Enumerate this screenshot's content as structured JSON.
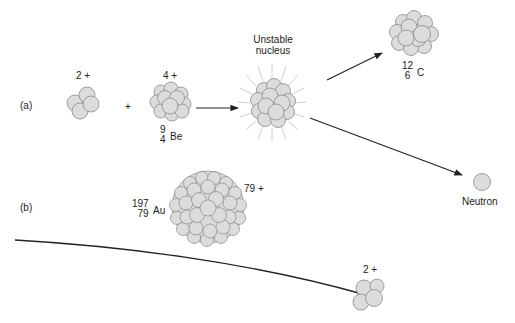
{
  "figure": {
    "panel_a": {
      "label": "(a)",
      "alpha": {
        "charge": "2 +"
      },
      "plus": "+",
      "beryllium": {
        "charge": "4 +",
        "mass_number": "9",
        "atomic_number": "4",
        "symbol": "Be"
      },
      "unstable": {
        "line1": "Unstable",
        "line2": "nucleus"
      },
      "carbon": {
        "mass_number": "12",
        "atomic_number": "6",
        "symbol": "C"
      },
      "neutron": {
        "label": "Neutron"
      }
    },
    "panel_b": {
      "label": "(b)",
      "gold": {
        "charge": "79 +",
        "mass_number": "197",
        "atomic_number": "79",
        "symbol": "Au"
      },
      "alpha": {
        "charge": "2 +"
      }
    },
    "colors": {
      "nucleon_fill": "#dcdcdc",
      "nucleon_stroke": "#8a8a8a",
      "arrow": "#222222",
      "burst": "#d0d0d0"
    }
  }
}
